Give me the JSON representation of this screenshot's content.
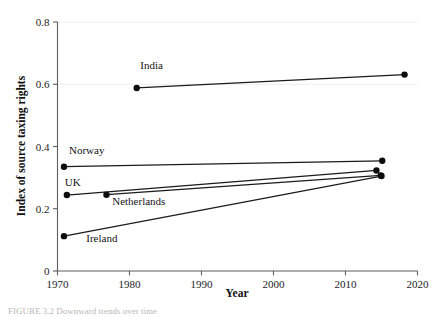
{
  "figure": {
    "caption": "FIGURE 3.2   Downward trends over time"
  },
  "chart_data": {
    "type": "line",
    "title": "",
    "xlabel": "Year",
    "ylabel": "Index of source taxing rights",
    "xlim": [
      1970,
      2020
    ],
    "ylim": [
      0,
      0.8
    ],
    "xticks": [
      "1970",
      "1980",
      "1990",
      "2000",
      "2010",
      "2020"
    ],
    "xtick_values": [
      1970,
      1980,
      1990,
      2000,
      2010,
      2020
    ],
    "yticks": [
      "0",
      "0.2",
      "0.4",
      "0.6",
      "0.8"
    ],
    "ytick_values": [
      0,
      0.2,
      0.4,
      0.6,
      0.8
    ],
    "grid": "faint horizontal gridlines at 0.6 and 0.8",
    "legend": "inline series labels next to lines",
    "series": [
      {
        "name": "India",
        "label": "India",
        "label_x": 1981.5,
        "label_y": 0.648,
        "x": [
          1981,
          2018.2
        ],
        "y": [
          0.588,
          0.631
        ]
      },
      {
        "name": "Norway",
        "label": "Norway",
        "label_x": 1971.6,
        "label_y": 0.377,
        "x": [
          1970.9,
          2015.1
        ],
        "y": [
          0.335,
          0.354
        ]
      },
      {
        "name": "UK",
        "label": "UK",
        "label_x": 1971.0,
        "label_y": 0.272,
        "x": [
          1971.3,
          2014.3
        ],
        "y": [
          0.244,
          0.323
        ]
      },
      {
        "name": "Netherlands",
        "label": "Netherlands",
        "label_x": 1977.6,
        "label_y": 0.213,
        "x": [
          1976.8,
          2014.9
        ],
        "y": [
          0.245,
          0.307
        ]
      },
      {
        "name": "Ireland",
        "label": "Ireland",
        "label_x": 1974.0,
        "label_y": 0.094,
        "x": [
          1970.9,
          2015.0
        ],
        "y": [
          0.112,
          0.305
        ]
      }
    ]
  }
}
